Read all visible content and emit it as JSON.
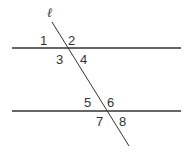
{
  "diagram": {
    "title": "",
    "transversal_label": "ℓ",
    "colors": {
      "line": "#333333",
      "text": "#333333",
      "background": "#ffffff"
    },
    "lines": {
      "parallel_top": {
        "x1": 12,
        "y1": 48,
        "x2": 181,
        "y2": 48
      },
      "parallel_bottom": {
        "x1": 12,
        "y1": 111,
        "x2": 181,
        "y2": 111
      },
      "transversal": {
        "x1": 52,
        "y1": 22,
        "x2": 129,
        "y2": 146
      }
    },
    "angles": [
      {
        "label": "1",
        "x": 48,
        "y": 46
      },
      {
        "label": "2",
        "x": 69,
        "y": 46
      },
      {
        "label": "3",
        "x": 57,
        "y": 63
      },
      {
        "label": "4",
        "x": 78,
        "y": 63
      },
      {
        "label": "5",
        "x": 84,
        "y": 108
      },
      {
        "label": "6",
        "x": 108,
        "y": 108
      },
      {
        "label": "7",
        "x": 96,
        "y": 125
      },
      {
        "label": "8",
        "x": 118,
        "y": 125
      }
    ]
  }
}
